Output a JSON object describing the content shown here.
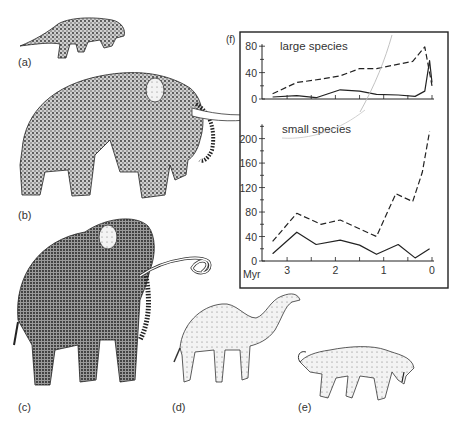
{
  "figure": {
    "panel_labels": {
      "a": "(a)",
      "b": "(b)",
      "c": "(c)",
      "d": "(d)",
      "e": "(e)",
      "f": "(f)"
    },
    "illustrations": [
      {
        "panel": "a",
        "subject": "small carnivore (mustelid-like)"
      },
      {
        "panel": "b",
        "subject": "mastodon with long straight tusks"
      },
      {
        "panel": "c",
        "subject": "woolly mammoth with curved tusks"
      },
      {
        "panel": "d",
        "subject": "camel"
      },
      {
        "panel": "e",
        "subject": "sabre-toothed cat"
      }
    ]
  },
  "chart_data": [
    {
      "type": "line",
      "title": "large species",
      "xlabel": "Myr",
      "ylabel": "",
      "x_ticks": [
        3,
        2,
        1,
        0
      ],
      "xlim": [
        3.45,
        0
      ],
      "y_ticks": [
        0,
        40,
        80
      ],
      "ylim": [
        0,
        80
      ],
      "grid": false,
      "series": [
        {
          "name": "dashed",
          "style": "dashed",
          "x": [
            3.3,
            2.8,
            2.3,
            1.9,
            1.5,
            1.15,
            0.4,
            0.15,
            0.0
          ],
          "values": [
            8,
            25,
            30,
            35,
            46,
            46,
            57,
            79,
            20
          ]
        },
        {
          "name": "solid",
          "style": "solid",
          "x": [
            3.3,
            2.8,
            2.4,
            1.9,
            1.5,
            1.15,
            0.7,
            0.35,
            0.15,
            0.05,
            0.0
          ],
          "values": [
            3,
            5,
            2,
            14,
            12,
            7,
            6,
            4,
            12,
            58,
            25
          ]
        }
      ]
    },
    {
      "type": "line",
      "title": "small species",
      "xlabel": "Myr",
      "ylabel": "",
      "x_ticks": [
        3,
        2,
        1,
        0
      ],
      "xlim": [
        3.45,
        0
      ],
      "y_ticks": [
        0,
        40,
        80,
        120,
        160,
        200
      ],
      "ylim": [
        0,
        220
      ],
      "grid": false,
      "series": [
        {
          "name": "dashed",
          "style": "dashed",
          "x": [
            3.3,
            2.8,
            2.3,
            1.9,
            1.15,
            0.75,
            0.4,
            0.2,
            0.05
          ],
          "values": [
            32,
            78,
            60,
            67,
            40,
            110,
            97,
            145,
            212
          ]
        },
        {
          "name": "solid",
          "style": "solid",
          "x": [
            3.3,
            2.8,
            2.4,
            1.9,
            1.5,
            1.15,
            0.7,
            0.35,
            0.05
          ],
          "values": [
            12,
            47,
            27,
            34,
            26,
            11,
            27,
            5,
            20
          ]
        }
      ]
    }
  ]
}
